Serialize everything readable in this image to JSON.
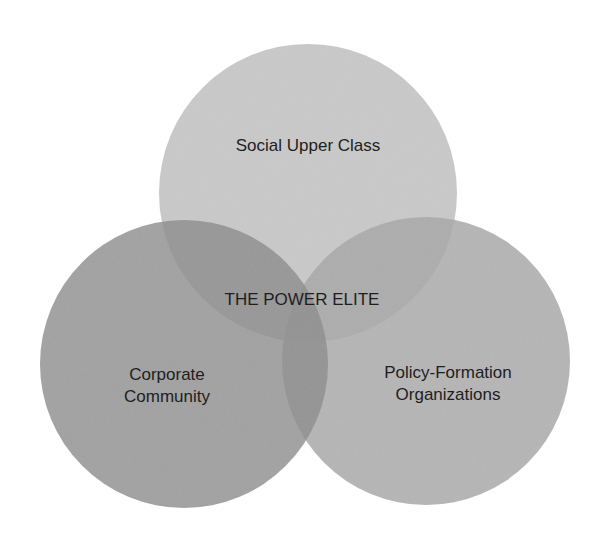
{
  "diagram": {
    "type": "venn",
    "title": "THE POWER ELITE",
    "circles": [
      {
        "id": "social-upper-class",
        "label_lines": [
          "Social Upper Class"
        ],
        "cx": 308,
        "cy": 193,
        "r": 149,
        "color": "#c8c8c8"
      },
      {
        "id": "corporate-community",
        "label_lines": [
          "Corporate",
          "Community"
        ],
        "cx": 184,
        "cy": 364,
        "r": 144,
        "color": "#9a9a9a"
      },
      {
        "id": "policy-formation-organizations",
        "label_lines": [
          "Policy-Formation",
          "Organizations"
        ],
        "cx": 426,
        "cy": 361,
        "r": 144,
        "color": "#b0b0b0"
      }
    ],
    "intersection_label": "THE POWER ELITE"
  }
}
